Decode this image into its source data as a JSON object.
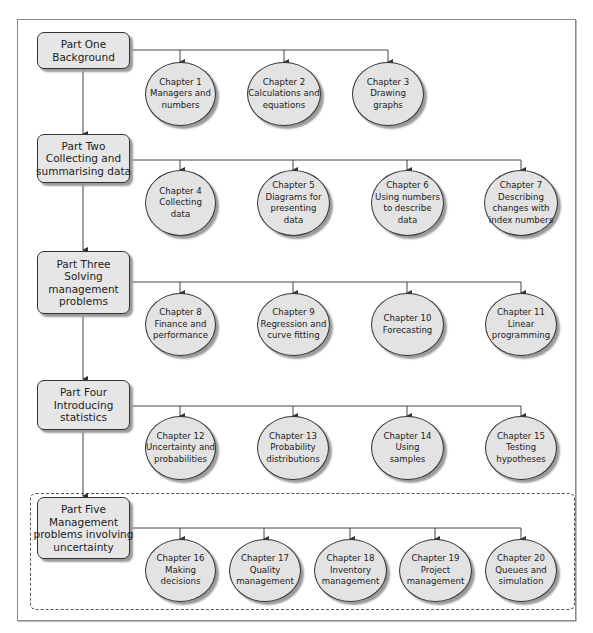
{
  "diagram": {
    "parts": [
      {
        "id": "part-one",
        "lines": [
          "Part One",
          "Background"
        ],
        "chapters": [
          {
            "lines": [
              "Chapter 1",
              "Managers and",
              "numbers"
            ]
          },
          {
            "lines": [
              "Chapter 2",
              "Calculations and",
              "equations"
            ]
          },
          {
            "lines": [
              "Chapter 3",
              "Drawing",
              "graphs"
            ]
          }
        ]
      },
      {
        "id": "part-two",
        "lines": [
          "Part Two",
          "Collecting and",
          "summarising data"
        ],
        "chapters": [
          {
            "lines": [
              "Chapter 4",
              "Collecting",
              "data"
            ]
          },
          {
            "lines": [
              "Chapter 5",
              "Diagrams for",
              "presenting",
              "data"
            ]
          },
          {
            "lines": [
              "Chapter 6",
              "Using numbers",
              "to describe",
              "data"
            ]
          },
          {
            "lines": [
              "Chapter 7",
              "Describing",
              "changes with",
              "index numbers"
            ]
          }
        ]
      },
      {
        "id": "part-three",
        "lines": [
          "Part Three",
          "Solving",
          "management",
          "problems"
        ],
        "chapters": [
          {
            "lines": [
              "Chapter 8",
              "Finance and",
              "performance"
            ]
          },
          {
            "lines": [
              "Chapter 9",
              "Regression and",
              "curve fitting"
            ]
          },
          {
            "lines": [
              "Chapter 10",
              "Forecasting"
            ]
          },
          {
            "lines": [
              "Chapter 11",
              "Linear",
              "programming"
            ]
          }
        ]
      },
      {
        "id": "part-four",
        "lines": [
          "Part Four",
          "Introducing",
          "statistics"
        ],
        "chapters": [
          {
            "lines": [
              "Chapter 12",
              "Uncertainty and",
              "probabilities"
            ]
          },
          {
            "lines": [
              "Chapter 13",
              "Probability",
              "distributions"
            ]
          },
          {
            "lines": [
              "Chapter 14",
              "Using",
              "samples"
            ]
          },
          {
            "lines": [
              "Chapter 15",
              "Testing",
              "hypotheses"
            ]
          }
        ]
      },
      {
        "id": "part-five",
        "lines": [
          "Part Five",
          "Management",
          "problems involving",
          "uncertainty"
        ],
        "chapters": [
          {
            "lines": [
              "Chapter 16",
              "Making",
              "decisions"
            ]
          },
          {
            "lines": [
              "Chapter 17",
              "Quality",
              "management"
            ]
          },
          {
            "lines": [
              "Chapter 18",
              "Inventory",
              "management"
            ]
          },
          {
            "lines": [
              "Chapter 19",
              "Project",
              "management"
            ]
          },
          {
            "lines": [
              "Chapter 20",
              "Queues and",
              "simulation"
            ]
          }
        ]
      }
    ],
    "colors": {
      "node_fill": "#e4e4e4",
      "stroke": "#333333",
      "shadow": "#9a9a9a"
    }
  }
}
